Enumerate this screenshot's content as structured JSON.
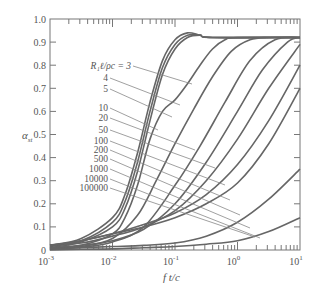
{
  "chart_data": {
    "type": "line",
    "title": "",
    "xlabel": "f t/c",
    "ylabel": "α_st",
    "xscale": "log",
    "xlim": [
      0.001,
      10
    ],
    "ylim": [
      0,
      1.0
    ],
    "x_ticks": [
      "10^-3",
      "10^-2",
      "10^-1",
      "10^0",
      "10^1"
    ],
    "y_ticks": [
      "0",
      "0.1",
      "0.2",
      "0.3",
      "0.4",
      "0.5",
      "0.6",
      "0.7",
      "0.8",
      "0.9",
      "1.0"
    ],
    "legend_title": "R₁ℓ/ρc =",
    "grid": false,
    "series": [
      {
        "name": "3",
        "log_x": [
          -3,
          -2.5,
          -2,
          -1.8,
          -1.6,
          -1.4,
          -1.2,
          -1.0,
          -0.8,
          -0.6,
          -0.4,
          1
        ],
        "values": [
          0.02,
          0.05,
          0.14,
          0.24,
          0.42,
          0.64,
          0.82,
          0.91,
          0.94,
          0.93,
          0.92,
          0.92
        ]
      },
      {
        "name": "4",
        "log_x": [
          -3,
          -2.5,
          -2,
          -1.8,
          -1.6,
          -1.4,
          -1.2,
          -1.0,
          -0.8,
          -0.6,
          -0.4,
          1
        ],
        "values": [
          0.015,
          0.04,
          0.12,
          0.21,
          0.38,
          0.6,
          0.79,
          0.89,
          0.93,
          0.93,
          0.92,
          0.92
        ]
      },
      {
        "name": "5",
        "log_x": [
          -3,
          -2.5,
          -2,
          -1.8,
          -1.6,
          -1.4,
          -1.2,
          -1.0,
          -0.8,
          -0.6,
          -0.4,
          1
        ],
        "values": [
          0.01,
          0.035,
          0.1,
          0.18,
          0.34,
          0.56,
          0.76,
          0.87,
          0.92,
          0.93,
          0.92,
          0.92
        ]
      },
      {
        "name": "10",
        "log_x": [
          -3,
          -2.5,
          -2,
          -1.8,
          -1.6,
          -1.4,
          -1.2,
          -1.0,
          -0.8,
          -0.6,
          -0.4,
          -0.2,
          0,
          1
        ],
        "values": [
          0.005,
          0.02,
          0.07,
          0.14,
          0.28,
          0.48,
          0.6,
          0.65,
          0.72,
          0.8,
          0.87,
          0.91,
          0.92,
          0.92
        ]
      },
      {
        "name": "20",
        "log_x": [
          -3,
          -2.5,
          -2,
          -1.6,
          -1.3,
          -1.0,
          -0.7,
          -0.4,
          -0.1,
          0.2,
          0.5,
          1
        ],
        "values": [
          0.005,
          0.015,
          0.05,
          0.15,
          0.3,
          0.46,
          0.61,
          0.75,
          0.86,
          0.91,
          0.92,
          0.92
        ]
      },
      {
        "name": "50",
        "log_x": [
          -3,
          -2.5,
          -2,
          -1.5,
          -1.0,
          -0.6,
          -0.2,
          0.2,
          0.6,
          1
        ],
        "values": [
          0.005,
          0.012,
          0.035,
          0.1,
          0.28,
          0.45,
          0.64,
          0.82,
          0.91,
          0.92
        ]
      },
      {
        "name": "100",
        "log_x": [
          -3,
          -2.5,
          -2,
          -1.5,
          -1.0,
          -0.5,
          0,
          0.4,
          0.8,
          1
        ],
        "values": [
          0.01,
          0.02,
          0.04,
          0.09,
          0.2,
          0.38,
          0.6,
          0.78,
          0.9,
          0.92
        ]
      },
      {
        "name": "200",
        "log_x": [
          -3,
          -2.5,
          -2,
          -1.5,
          -1.0,
          -0.5,
          0,
          0.5,
          1
        ],
        "values": [
          0.02,
          0.03,
          0.06,
          0.1,
          0.17,
          0.3,
          0.48,
          0.7,
          0.89
        ]
      },
      {
        "name": "500",
        "log_x": [
          -3,
          -2.5,
          -2,
          -1.5,
          -1.0,
          -0.5,
          0,
          0.5,
          1
        ],
        "values": [
          0.02,
          0.04,
          0.07,
          0.11,
          0.16,
          0.24,
          0.37,
          0.56,
          0.8
        ]
      },
      {
        "name": "1000",
        "log_x": [
          -3,
          -2.5,
          -2,
          -1.5,
          -1.0,
          -0.5,
          0,
          0.5,
          1
        ],
        "values": [
          0.02,
          0.04,
          0.07,
          0.1,
          0.14,
          0.2,
          0.29,
          0.46,
          0.7
        ]
      },
      {
        "name": "10000",
        "log_x": [
          -3,
          -2.5,
          -2,
          -1.5,
          -1.0,
          -0.5,
          0,
          0.5,
          1
        ],
        "values": [
          0.005,
          0.01,
          0.015,
          0.02,
          0.03,
          0.06,
          0.12,
          0.22,
          0.35
        ]
      },
      {
        "name": "100000",
        "log_x": [
          -3,
          -2.5,
          -2,
          -1.5,
          -1.0,
          -0.5,
          0,
          0.5,
          1
        ],
        "values": [
          0.0,
          0.003,
          0.005,
          0.01,
          0.015,
          0.025,
          0.04,
          0.08,
          0.14
        ]
      }
    ],
    "label_positions": [
      {
        "name": "R₁ℓ/ρc = 3",
        "lx": 131,
        "ly": 69,
        "tx": 192,
        "ty": 84
      },
      {
        "name": "4",
        "lx": 108,
        "ly": 81,
        "tx": 180,
        "ty": 105
      },
      {
        "name": "5",
        "lx": 108,
        "ly": 92,
        "tx": 172,
        "ty": 117
      },
      {
        "name": "10",
        "lx": 108,
        "ly": 111,
        "tx": 158,
        "ty": 130
      },
      {
        "name": "20",
        "lx": 108,
        "ly": 121,
        "tx": 195,
        "ty": 150
      },
      {
        "name": "50",
        "lx": 108,
        "ly": 133,
        "tx": 215,
        "ty": 168
      },
      {
        "name": "100",
        "lx": 108,
        "ly": 144,
        "tx": 225,
        "ty": 185
      },
      {
        "name": "200",
        "lx": 108,
        "ly": 153,
        "tx": 230,
        "ty": 200
      },
      {
        "name": "500",
        "lx": 108,
        "ly": 162,
        "tx": 240,
        "ty": 215
      },
      {
        "name": "1000",
        "lx": 108,
        "ly": 172,
        "tx": 250,
        "ty": 228
      },
      {
        "name": "10000",
        "lx": 108,
        "ly": 182,
        "tx": 260,
        "ty": 238
      },
      {
        "name": "100000",
        "lx": 108,
        "ly": 191,
        "tx": 255,
        "ty": 237
      }
    ]
  }
}
